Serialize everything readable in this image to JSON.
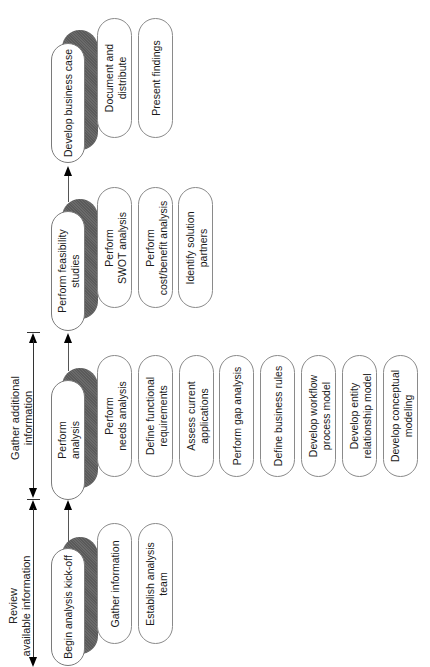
{
  "phases": [
    {
      "id": "develop-business-case",
      "label": "Develop business case",
      "tasks": [
        "Document and\ndistribute",
        "Present findings"
      ]
    },
    {
      "id": "perform-feasibility-studies",
      "label": "Perform feasibility\nstudies",
      "tasks": [
        "Perform\nSWOT analysis",
        "Perform\ncost/benefit analysis",
        "Identify solution\npartners"
      ]
    },
    {
      "id": "perform-analysis",
      "label": "Perform\nanalysis",
      "tasks": [
        "Perform\nneeds analysis",
        "Define functional\nrequirements",
        "Assess current\napplications",
        "Perform gap analysis",
        "Define business rules",
        "Develop workflow\nprocess model",
        "Develop entity\nrelationship model",
        "Develop conceptual\nmodeling"
      ]
    },
    {
      "id": "begin-analysis-kick-off",
      "label": "Begin analysis kick-off",
      "tasks": [
        "Gather information",
        "Establish analysis\nteam"
      ]
    }
  ],
  "spans": [
    {
      "id": "gather-additional-information",
      "label": "Gather additional\ninformation"
    },
    {
      "id": "review-available-information",
      "label": "Review\navailable information"
    }
  ],
  "colors": {
    "shadow": "#5f5f5f",
    "outline": "#8a8a8a",
    "line": "#333333",
    "background": "#ffffff"
  }
}
